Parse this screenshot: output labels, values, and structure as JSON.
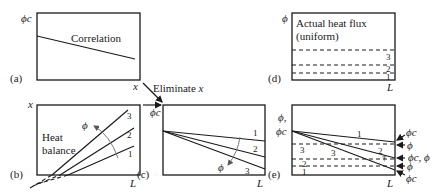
{
  "figure": {
    "panels": {
      "a": {
        "label": "(a)",
        "y_axis": "ϕc",
        "x_axis": "x",
        "curve_label": "Correlation"
      },
      "b": {
        "label": "(b)",
        "y_axis": "x",
        "x_axis": "L",
        "region_label_1": "Heat",
        "region_label_2": "balance",
        "arrow_label": "ϕ",
        "lines": [
          "1",
          "2",
          "3"
        ]
      },
      "c": {
        "label": "(c)",
        "y_axis": "ϕc",
        "x_axis": "L",
        "arrow_label": "ϕ",
        "lines": [
          "1",
          "2",
          "3"
        ]
      },
      "d": {
        "label": "(d)",
        "y_axis": "ϕ",
        "x_axis": "L",
        "title_1": "Actual heat flux",
        "title_2": "(uniform)",
        "levels": [
          "3",
          "2",
          "1"
        ]
      },
      "e": {
        "label": "(e)",
        "y_axis_1": "ϕ,",
        "y_axis_2": "ϕc",
        "x_axis": "L",
        "line_labels": [
          "1",
          "2",
          "3"
        ],
        "dashed_labels": [
          "3",
          "2",
          "1"
        ],
        "right_annotations": [
          "ϕc",
          "ϕ",
          "ϕc, ϕ",
          "ϕ",
          "ϕc"
        ],
        "marker": "†"
      }
    },
    "connector": {
      "label": "Eliminate",
      "variable": "x"
    }
  }
}
